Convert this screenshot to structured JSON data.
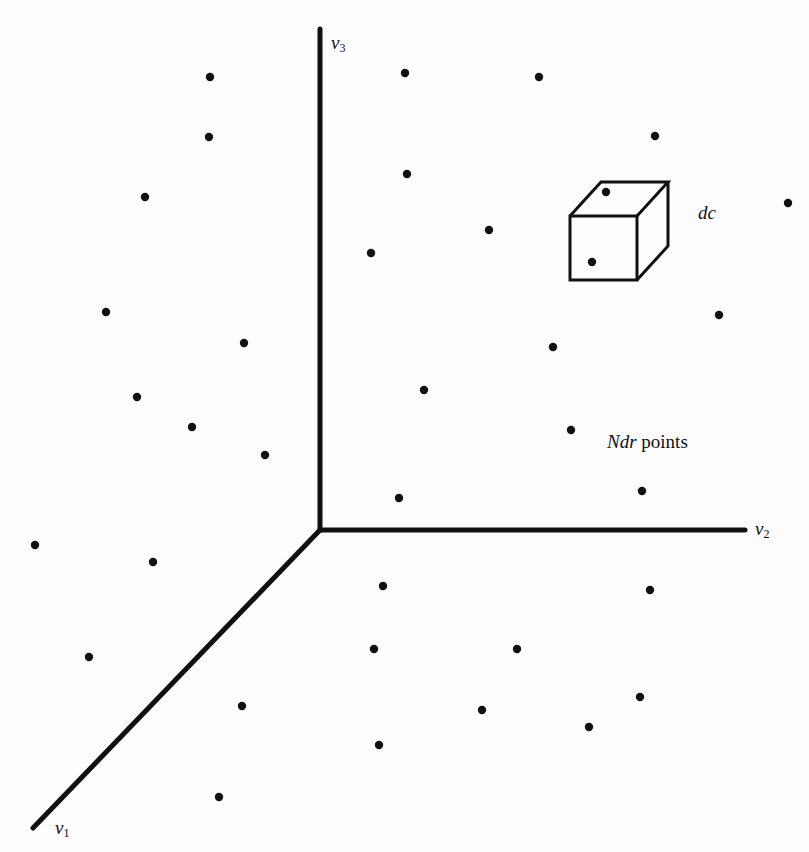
{
  "figure": {
    "colors": {
      "background": "#fdfdfd",
      "ink": "#111111"
    },
    "axes": {
      "origin": [
        320,
        530
      ],
      "v3": {
        "name": "v",
        "sub": "3",
        "end": [
          320,
          29
        ],
        "label_pos": [
          331,
          33
        ]
      },
      "v2": {
        "name": "v",
        "sub": "2",
        "end": [
          745,
          530
        ],
        "label_pos": [
          755,
          519
        ]
      },
      "v1": {
        "name": "v",
        "sub": "1",
        "end": [
          33,
          828
        ],
        "label_pos": [
          55,
          818
        ]
      },
      "stroke_width": 5
    },
    "cube": {
      "front": {
        "x": 570,
        "y": 216,
        "w": 67,
        "h": 64
      },
      "offset": [
        31,
        -34
      ],
      "stroke_width": 3,
      "label": "dc",
      "label_pos": [
        698,
        203
      ],
      "inner_points": [
        [
          606,
          192
        ],
        [
          592,
          262
        ]
      ]
    },
    "region_label": {
      "italic_part": "Ndr",
      "text_part": " points",
      "pos": [
        607,
        432
      ]
    },
    "points": [
      [
        210,
        77
      ],
      [
        405,
        73
      ],
      [
        539,
        77
      ],
      [
        209,
        137
      ],
      [
        655,
        136
      ],
      [
        407,
        174
      ],
      [
        145,
        197
      ],
      [
        788,
        203
      ],
      [
        489,
        230
      ],
      [
        371,
        253
      ],
      [
        106,
        312
      ],
      [
        719,
        315
      ],
      [
        244,
        343
      ],
      [
        553,
        347
      ],
      [
        424,
        390
      ],
      [
        137,
        397
      ],
      [
        192,
        427
      ],
      [
        571,
        430
      ],
      [
        265,
        455
      ],
      [
        642,
        491
      ],
      [
        399,
        498
      ],
      [
        35,
        545
      ],
      [
        153,
        562
      ],
      [
        383,
        586
      ],
      [
        650,
        590
      ],
      [
        374,
        649
      ],
      [
        517,
        649
      ],
      [
        89,
        657
      ],
      [
        640,
        697
      ],
      [
        242,
        706
      ],
      [
        482,
        710
      ],
      [
        589,
        727
      ],
      [
        379,
        745
      ],
      [
        219,
        797
      ]
    ],
    "point_radius": 4.2
  }
}
